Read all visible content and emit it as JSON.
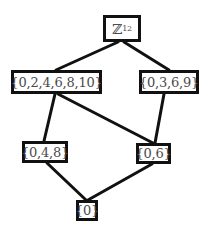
{
  "diagram": {
    "nodes": [
      {
        "id": "z12",
        "label": "ℤ",
        "subscript": "12"
      },
      {
        "id": "even",
        "label": "{0,2,4,6,8,10}"
      },
      {
        "id": "0369",
        "label": "{0,3,6,9}"
      },
      {
        "id": "048",
        "label": "{0,4,8}"
      },
      {
        "id": "06",
        "label": "{0,6}"
      },
      {
        "id": "0",
        "label": "{0}"
      }
    ],
    "edges": [
      {
        "from": "z12",
        "to": "even"
      },
      {
        "from": "z12",
        "to": "0369"
      },
      {
        "from": "even",
        "to": "048"
      },
      {
        "from": "even",
        "to": "06"
      },
      {
        "from": "0369",
        "to": "06"
      },
      {
        "from": "048",
        "to": "0"
      },
      {
        "from": "06",
        "to": "0"
      }
    ],
    "colors": {
      "line": "#111111",
      "text": "#4a4a4a",
      "background": "#ffffff"
    }
  }
}
